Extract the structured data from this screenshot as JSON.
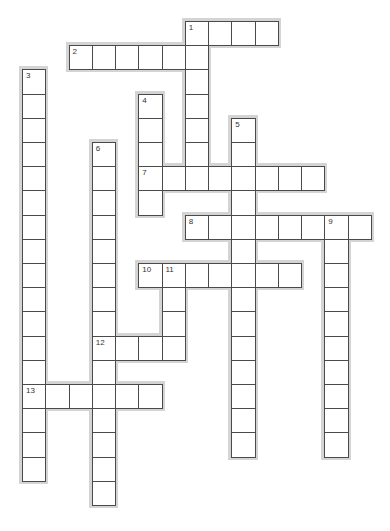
{
  "puzzle": {
    "type": "crossword",
    "grid": {
      "origin_x": 22,
      "origin_y": 21,
      "cell_w": 23.25,
      "cell_h": 24.2
    },
    "colors": {
      "border": "#4a4a4a",
      "shadow": "#d4d4d4",
      "cell_bg": "#ffffff"
    },
    "words": [
      {
        "number": "1",
        "direction": "down",
        "col": 7,
        "row": 0,
        "length": 7
      },
      {
        "number": "1",
        "direction": "across",
        "col": 7,
        "row": 0,
        "length": 4
      },
      {
        "number": "2",
        "direction": "across",
        "col": 2,
        "row": 1,
        "length": 6
      },
      {
        "number": "3",
        "direction": "down",
        "col": 0,
        "row": 2,
        "length": 17
      },
      {
        "number": "4",
        "direction": "down",
        "col": 5,
        "row": 3,
        "length": 5
      },
      {
        "number": "5",
        "direction": "down",
        "col": 9,
        "row": 4,
        "length": 14
      },
      {
        "number": "6",
        "direction": "down",
        "col": 3,
        "row": 5,
        "length": 15
      },
      {
        "number": "7",
        "direction": "across",
        "col": 5,
        "row": 6,
        "length": 8
      },
      {
        "number": "8",
        "direction": "across",
        "col": 7,
        "row": 8,
        "length": 8
      },
      {
        "number": "9",
        "direction": "down",
        "col": 13,
        "row": 8,
        "length": 10
      },
      {
        "number": "10",
        "direction": "across",
        "col": 5,
        "row": 10,
        "length": 7
      },
      {
        "number": "11",
        "direction": "down",
        "col": 6,
        "row": 10,
        "length": 4
      },
      {
        "number": "12",
        "direction": "across",
        "col": 3,
        "row": 13,
        "length": 4
      },
      {
        "number": "13",
        "direction": "across",
        "col": 0,
        "row": 15,
        "length": 6
      }
    ],
    "numbered_cells": [
      {
        "number": "1",
        "col": 7,
        "row": 0
      },
      {
        "number": "2",
        "col": 2,
        "row": 1
      },
      {
        "number": "3",
        "col": 0,
        "row": 2
      },
      {
        "number": "4",
        "col": 5,
        "row": 3
      },
      {
        "number": "5",
        "col": 9,
        "row": 4
      },
      {
        "number": "6",
        "col": 3,
        "row": 5
      },
      {
        "number": "7",
        "col": 5,
        "row": 6
      },
      {
        "number": "8",
        "col": 7,
        "row": 8
      },
      {
        "number": "9",
        "col": 13,
        "row": 8
      },
      {
        "number": "10",
        "col": 5,
        "row": 10
      },
      {
        "number": "11",
        "col": 6,
        "row": 10
      },
      {
        "number": "12",
        "col": 3,
        "row": 13
      },
      {
        "number": "13",
        "col": 0,
        "row": 15
      }
    ]
  }
}
